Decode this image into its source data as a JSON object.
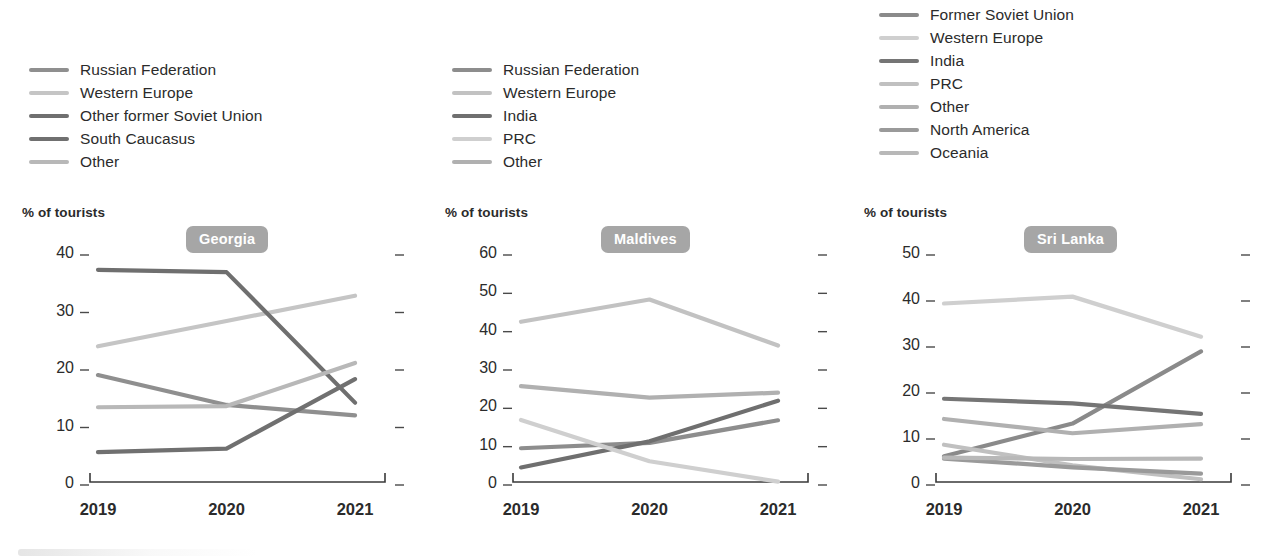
{
  "axis_label": "% of tourists",
  "x_categories": [
    "2019",
    "2020",
    "2021"
  ],
  "badge_color": "#a6a6a6",
  "palette": {
    "dark": "#6e6e6e",
    "mid_dark": "#808080",
    "mid": "#949494",
    "light": "#b5b5b5",
    "lighter": "#c9c9c9",
    "lightest": "#d8d8d8",
    "very_dark": "#5f5f5f"
  },
  "chart_data": [
    {
      "type": "line",
      "title": "Georgia",
      "xlabel": "",
      "ylabel": "% of tourists",
      "x": [
        "2019",
        "2020",
        "2021"
      ],
      "ylim": [
        0,
        40
      ],
      "yticks": [
        0,
        10,
        20,
        30,
        40
      ],
      "grid": false,
      "legend_position": "above-left",
      "series": [
        {
          "name": "Russian Federation",
          "color": "#8f8f8f",
          "values": [
            18.6,
            13.4,
            11.6
          ]
        },
        {
          "name": "Western Europe",
          "color": "#c5c5c5",
          "values": [
            23.6,
            28.0,
            32.4
          ]
        },
        {
          "name": "Other former Soviet Union",
          "color": "#6f6f6f",
          "values": [
            36.9,
            36.5,
            13.8
          ]
        },
        {
          "name": "South Caucasus",
          "color": "#707070",
          "values": [
            5.2,
            5.8,
            17.9
          ]
        },
        {
          "name": "Other",
          "color": "#b8b8b8",
          "values": [
            13.0,
            13.2,
            20.7
          ]
        }
      ]
    },
    {
      "type": "line",
      "title": "Maldives",
      "xlabel": "",
      "ylabel": "% of tourists",
      "x": [
        "2019",
        "2020",
        "2021"
      ],
      "ylim": [
        0,
        60
      ],
      "yticks": [
        0,
        10,
        20,
        30,
        40,
        50,
        60
      ],
      "grid": false,
      "legend_position": "above-left",
      "series": [
        {
          "name": "Russian Federation",
          "color": "#8d8d8d",
          "values": [
            8.8,
            10.2,
            16.1
          ]
        },
        {
          "name": "Western Europe",
          "color": "#c2c2c2",
          "values": [
            41.8,
            47.6,
            35.6
          ]
        },
        {
          "name": "India",
          "color": "#6f6f6f",
          "values": [
            3.8,
            10.6,
            21.2
          ]
        },
        {
          "name": "PRC",
          "color": "#cfcfcf",
          "values": [
            16.2,
            5.4,
            0.1
          ]
        },
        {
          "name": "Other",
          "color": "#b0b0b0",
          "values": [
            25.0,
            22.0,
            23.3
          ]
        }
      ]
    },
    {
      "type": "line",
      "title": "Sri Lanka",
      "xlabel": "",
      "ylabel": "% of tourists",
      "x": [
        "2019",
        "2020",
        "2021"
      ],
      "ylim": [
        0,
        50
      ],
      "yticks": [
        0,
        10,
        20,
        30,
        40,
        50
      ],
      "grid": false,
      "legend_position": "above-left",
      "series": [
        {
          "name": "Former Soviet Union",
          "color": "#8a8a8a",
          "values": [
            5.6,
            12.7,
            28.4
          ]
        },
        {
          "name": "Western Europe",
          "color": "#cfcfcf",
          "values": [
            38.8,
            40.3,
            31.6
          ]
        },
        {
          "name": "India",
          "color": "#757575",
          "values": [
            18.1,
            17.1,
            14.8
          ]
        },
        {
          "name": "PRC",
          "color": "#c0c0c0",
          "values": [
            8.1,
            3.6,
            0.6
          ]
        },
        {
          "name": "Other",
          "color": "#b0b0b0",
          "values": [
            13.7,
            10.6,
            12.6
          ]
        },
        {
          "name": "North America",
          "color": "#9a9a9a",
          "values": [
            5.1,
            3.2,
            1.8
          ]
        },
        {
          "name": "Oceania",
          "color": "#b8b8b8",
          "values": [
            5.3,
            5.0,
            5.1
          ]
        }
      ]
    }
  ],
  "panels": [
    {
      "key": "georgia",
      "legend": [
        {
          "label": "Russian Federation",
          "color": "#8f8f8f"
        },
        {
          "label": "Western Europe",
          "color": "#c5c5c5"
        },
        {
          "label": "Other former Soviet Union",
          "color": "#6f6f6f"
        },
        {
          "label": "South Caucasus",
          "color": "#707070"
        },
        {
          "label": "Other",
          "color": "#b8b8b8"
        }
      ]
    },
    {
      "key": "maldives",
      "legend": [
        {
          "label": "Russian Federation",
          "color": "#8d8d8d"
        },
        {
          "label": "Western Europe",
          "color": "#c2c2c2"
        },
        {
          "label": "India",
          "color": "#6f6f6f"
        },
        {
          "label": "PRC",
          "color": "#cfcfcf"
        },
        {
          "label": "Other",
          "color": "#b0b0b0"
        }
      ]
    },
    {
      "key": "srilanka",
      "legend": [
        {
          "label": "Former Soviet Union",
          "color": "#8a8a8a"
        },
        {
          "label": "Western Europe",
          "color": "#cfcfcf"
        },
        {
          "label": "India",
          "color": "#757575"
        },
        {
          "label": "PRC",
          "color": "#c0c0c0"
        },
        {
          "label": "Other",
          "color": "#b0b0b0"
        },
        {
          "label": "North America",
          "color": "#9a9a9a"
        },
        {
          "label": "Oceania",
          "color": "#b8b8b8"
        }
      ]
    }
  ]
}
